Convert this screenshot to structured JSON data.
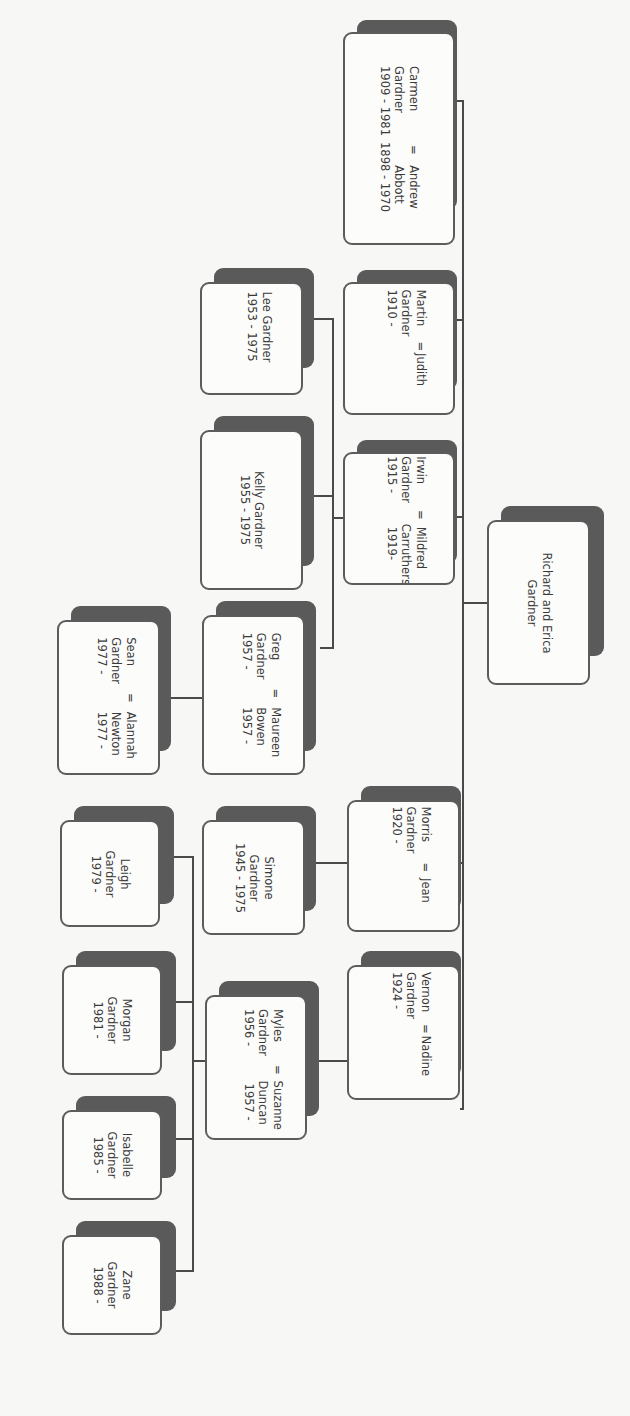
{
  "diagram": {
    "type": "family-tree",
    "orientation": "rotated-90-clockwise",
    "colors": {
      "box_border": "#5c5c5c",
      "box_fill": "#fcfcfb",
      "shadow": "#5a5a5a",
      "line": "#4a4a4a",
      "background": "#f7f7f5"
    },
    "root": {
      "line1": "Richard and Erica",
      "line2": "Gardner"
    },
    "generation1": [
      {
        "name": "Carmen",
        "surname": "Gardner",
        "dates": "1909 - 1981",
        "spouse": "Andrew",
        "spouse_surname": "Abbott",
        "spouse_dates": "1898 - 1970"
      },
      {
        "name": "Martin",
        "surname": "Gardner",
        "dates": "1910 -",
        "spouse": "Judith",
        "spouse_surname": "",
        "spouse_dates": ""
      },
      {
        "name": "Irwin",
        "surname": "Gardner",
        "dates": "1915 -",
        "spouse": "Mildred",
        "spouse_surname": "Carruthers",
        "spouse_dates": "1919-"
      },
      {
        "name": "Morris",
        "surname": "Gardner",
        "dates": "1920 -",
        "spouse": "Jean",
        "spouse_surname": "",
        "spouse_dates": ""
      },
      {
        "name": "Vernon",
        "surname": "Gardner",
        "dates": "1924 -",
        "spouse": "Nadine",
        "spouse_surname": "",
        "spouse_dates": ""
      }
    ],
    "irwin_children": [
      {
        "line1": "Lee Gardner",
        "line2": "1953 - 1975"
      },
      {
        "line1": "Kelly Gardner",
        "line2": "1955 - 1975"
      },
      {
        "name": "Greg",
        "surname": "Gardner",
        "dates": "1957 -",
        "spouse": "Maureen",
        "spouse_surname": "Bowen",
        "spouse_dates": "1957 -"
      }
    ],
    "greg_children": [
      {
        "name": "Sean",
        "surname": "Gardner",
        "dates": "1977 -",
        "spouse": "Alannah",
        "spouse_surname": "Newton",
        "spouse_dates": "1977 -"
      }
    ],
    "morris_children": [
      {
        "line1": "Simone",
        "line2": "Gardner",
        "line3": "1945 - 1975"
      }
    ],
    "vernon_children": [
      {
        "name": "Myles",
        "surname": "Gardner",
        "dates": "1956 -",
        "spouse": "Suzanne",
        "spouse_surname": "Duncan",
        "spouse_dates": "1957 -"
      }
    ],
    "myles_children": [
      {
        "line1": "Leigh",
        "line2": "Gardner",
        "line3": "1979 -"
      },
      {
        "line1": "Morgan",
        "line2": "Gardner",
        "line3": "1981 -"
      },
      {
        "line1": "Isabelle",
        "line2": "Gardner",
        "line3": "1985 -"
      },
      {
        "line1": "Zane",
        "line2": "Gardner",
        "line3": "1988 -"
      }
    ],
    "marriage_symbol": "="
  }
}
